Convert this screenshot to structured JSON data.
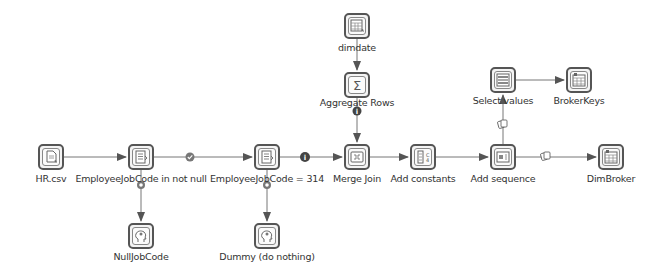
{
  "diagram": {
    "type": "etl-transformation",
    "nodes": [
      {
        "id": "hr_csv",
        "label": "HR.csv",
        "icon": "csv-input-icon",
        "x": 51,
        "y": 157
      },
      {
        "id": "not_null",
        "label": "EmployeeJobCode in not null",
        "icon": "filter-rows-icon",
        "x": 141,
        "y": 157
      },
      {
        "id": "eq_314",
        "label": "EmployeeJobCode = 314",
        "icon": "filter-rows-icon",
        "x": 267,
        "y": 157
      },
      {
        "id": "merge_join",
        "label": "Merge Join",
        "icon": "merge-join-icon",
        "x": 357,
        "y": 157
      },
      {
        "id": "add_constants",
        "label": "Add constants",
        "icon": "add-constants-icon",
        "x": 423,
        "y": 157
      },
      {
        "id": "add_sequence",
        "label": "Add sequence",
        "icon": "add-sequence-icon",
        "x": 503,
        "y": 157
      },
      {
        "id": "dimbroker",
        "label": "DimBroker",
        "icon": "table-output-icon",
        "x": 611,
        "y": 157
      },
      {
        "id": "dimdate",
        "label": "dimdate",
        "icon": "table-input-icon",
        "x": 357,
        "y": 26
      },
      {
        "id": "aggregate",
        "label": "Aggregate Rows",
        "icon": "sigma-icon",
        "x": 357,
        "y": 85
      },
      {
        "id": "select_values",
        "label": "Select values",
        "icon": "select-values-icon",
        "x": 503,
        "y": 80
      },
      {
        "id": "brokerkeys",
        "label": "BrokerKeys",
        "icon": "table-output-icon",
        "x": 579,
        "y": 80
      },
      {
        "id": "nulljobcode",
        "label": "NullJobCode",
        "icon": "dummy-icon",
        "x": 141,
        "y": 236
      },
      {
        "id": "dummy",
        "label": "Dummy (do nothing)",
        "icon": "dummy-icon",
        "x": 267,
        "y": 236
      }
    ],
    "edges": [
      {
        "from": "hr_csv",
        "to": "not_null",
        "marker": "none"
      },
      {
        "from": "not_null",
        "to": "eq_314",
        "marker": "true-check"
      },
      {
        "from": "not_null",
        "to": "nulljobcode",
        "marker": "false-x"
      },
      {
        "from": "eq_314",
        "to": "merge_join",
        "marker": "info"
      },
      {
        "from": "eq_314",
        "to": "dummy",
        "marker": "false-x"
      },
      {
        "from": "dimdate",
        "to": "aggregate",
        "marker": "none"
      },
      {
        "from": "aggregate",
        "to": "merge_join",
        "marker": "info"
      },
      {
        "from": "merge_join",
        "to": "add_constants",
        "marker": "none"
      },
      {
        "from": "add_constants",
        "to": "add_sequence",
        "marker": "none"
      },
      {
        "from": "add_sequence",
        "to": "dimbroker",
        "marker": "copy"
      },
      {
        "from": "add_sequence",
        "to": "select_values",
        "marker": "copy"
      },
      {
        "from": "select_values",
        "to": "brokerkeys",
        "marker": "none"
      }
    ]
  }
}
